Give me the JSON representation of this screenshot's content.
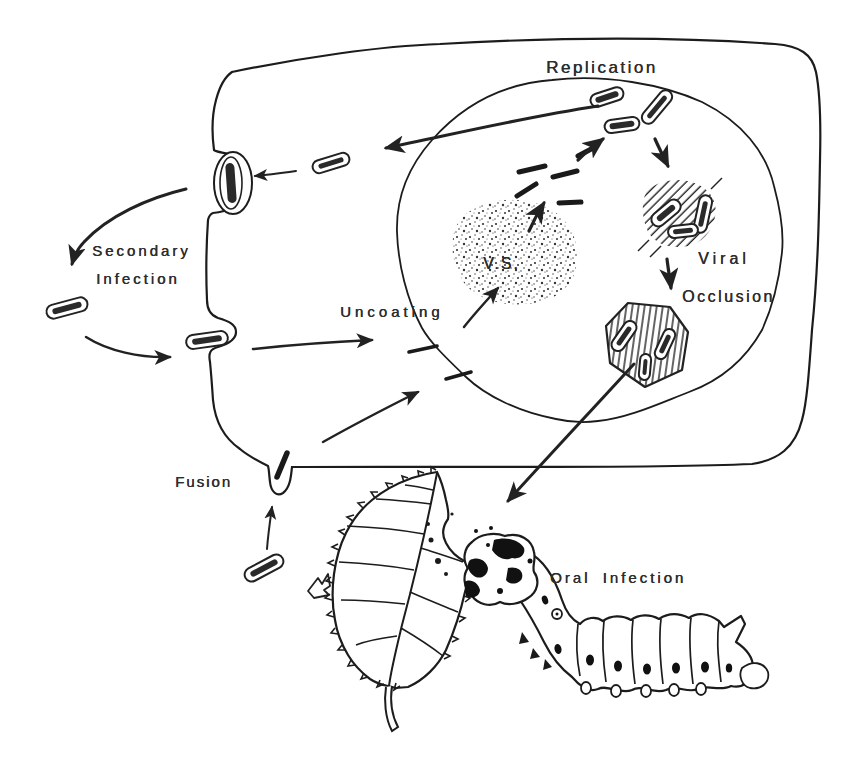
{
  "diagram": {
    "labels": {
      "replication": "Replication",
      "secondary_line1": "Secondary",
      "secondary_line2": "Infection",
      "vs": "V.S.",
      "uncoating": "Uncoating",
      "viral_line1": "Viral",
      "viral_line2": "Occlusion",
      "fusion": "Fusion",
      "oral_infection": "Oral Infection"
    },
    "colors": {
      "ink": "#222222",
      "paper": "#ffffff"
    }
  }
}
